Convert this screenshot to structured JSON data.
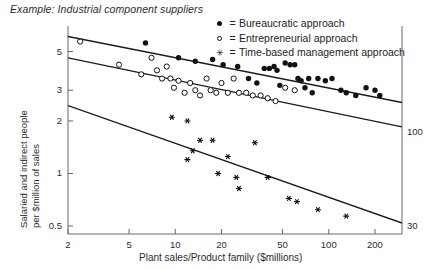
{
  "title": "Example: Industrial component suppliers",
  "legend": {
    "position": "top-right",
    "items": [
      {
        "marker": "filled-circle",
        "glyph": "●",
        "eq": "=",
        "label": "Bureaucratic approach"
      },
      {
        "marker": "open-circle",
        "glyph": "○",
        "eq": "=",
        "label": "Entrepreneurial approach"
      },
      {
        "marker": "asterisk",
        "glyph": "✳",
        "eq": "=",
        "label": "Time-based management approach"
      }
    ]
  },
  "chart_data": {
    "type": "scatter",
    "title": "Example: Industrial component suppliers",
    "xlabel": "Plant sales/Product family ($millions)",
    "ylabel": "Salaried and indirect people per $million of sales",
    "ylabel_line1": "Salaried and indirect people",
    "ylabel_line2": "per $million of sales",
    "xscale": "log",
    "yscale": "log",
    "xlim": [
      2,
      300
    ],
    "ylim": [
      0.45,
      7
    ],
    "grid": false,
    "xticks": [
      2,
      5,
      10,
      20,
      50,
      100,
      200
    ],
    "xticklabels": [
      "2",
      "5",
      "10",
      "20",
      "50",
      "100",
      "200"
    ],
    "yticks": [
      5,
      3,
      2,
      1,
      0.5
    ],
    "yticklabels": [
      "5",
      "3",
      "2",
      "1",
      "0.5"
    ],
    "right_axis_labels": [
      {
        "value": 100,
        "label": "100",
        "y_data": 1.72
      },
      {
        "value": 30,
        "label": "30",
        "y_data": 0.5
      }
    ],
    "series": [
      {
        "name": "Bureaucratic approach",
        "marker": "filled-circle",
        "color": "#111111",
        "points": [
          [
            6.4,
            5.6
          ],
          [
            10.5,
            4.6
          ],
          [
            13.5,
            4.4
          ],
          [
            17.5,
            4.5
          ],
          [
            20.5,
            4.2
          ],
          [
            25.5,
            4.1
          ],
          [
            30.0,
            3.5
          ],
          [
            34.0,
            3.3
          ],
          [
            38.0,
            4.0
          ],
          [
            41.0,
            4.0
          ],
          [
            44.0,
            4.1
          ],
          [
            46.0,
            3.9
          ],
          [
            48.0,
            3.2
          ],
          [
            52.0,
            4.3
          ],
          [
            56.0,
            4.2
          ],
          [
            60.0,
            4.2
          ],
          [
            63.0,
            3.5
          ],
          [
            66.0,
            3.4
          ],
          [
            70.0,
            3.1
          ],
          [
            74.0,
            3.5
          ],
          [
            78.0,
            2.9
          ],
          [
            85.0,
            3.5
          ],
          [
            95.0,
            3.4
          ],
          [
            105.0,
            3.5
          ],
          [
            120.0,
            3.0
          ],
          [
            130.0,
            2.9
          ],
          [
            150.0,
            2.8
          ],
          [
            175.0,
            3.1
          ],
          [
            200.0,
            3.0
          ],
          [
            215.0,
            2.8
          ]
        ]
      },
      {
        "name": "Entrepreneurial approach",
        "marker": "open-circle",
        "color": "#111111",
        "points": [
          [
            2.4,
            5.7
          ],
          [
            4.3,
            4.2
          ],
          [
            6.0,
            3.7
          ],
          [
            7.0,
            4.6
          ],
          [
            7.6,
            3.9
          ],
          [
            8.2,
            3.5
          ],
          [
            8.8,
            4.1
          ],
          [
            9.3,
            3.5
          ],
          [
            9.8,
            3.1
          ],
          [
            10.5,
            3.4
          ],
          [
            11.5,
            2.9
          ],
          [
            12.5,
            3.3
          ],
          [
            13.5,
            3.0
          ],
          [
            14.5,
            2.8
          ],
          [
            16.0,
            3.5
          ],
          [
            17.0,
            3.0
          ],
          [
            18.5,
            2.9
          ],
          [
            20.0,
            3.3
          ],
          [
            22.0,
            2.9
          ],
          [
            24.0,
            3.5
          ],
          [
            26.0,
            2.9
          ],
          [
            29.0,
            2.9
          ],
          [
            32.0,
            2.8
          ],
          [
            36.0,
            2.8
          ],
          [
            40.0,
            2.7
          ],
          [
            45.0,
            2.6
          ],
          [
            52.0,
            3.1
          ],
          [
            60.0,
            3.0
          ]
        ]
      },
      {
        "name": "Time-based management approach",
        "marker": "asterisk",
        "color": "#111111",
        "points": [
          [
            9.5,
            2.1
          ],
          [
            12.0,
            2.0
          ],
          [
            14.5,
            1.55
          ],
          [
            17.5,
            1.55
          ],
          [
            13.0,
            1.35
          ],
          [
            12.0,
            1.2
          ],
          [
            22.0,
            1.25
          ],
          [
            19.0,
            1.0
          ],
          [
            25.0,
            0.95
          ],
          [
            26.0,
            0.82
          ],
          [
            40.0,
            0.95
          ],
          [
            55.0,
            0.72
          ],
          [
            62.0,
            0.69
          ],
          [
            85.0,
            0.62
          ],
          [
            130.0,
            0.57
          ],
          [
            33.0,
            1.5
          ]
        ]
      }
    ],
    "trendlines": [
      {
        "name": "bureaucratic-fit",
        "x0": 2,
        "y0": 6.1,
        "x1": 300,
        "y1": 2.55
      },
      {
        "name": "entrepreneurial-fit",
        "x0": 2,
        "y0": 4.6,
        "x1": 300,
        "y1": 1.85
      },
      {
        "name": "time-based-fit",
        "x0": 2,
        "y0": 2.45,
        "x1": 300,
        "y1": 0.52
      }
    ]
  }
}
